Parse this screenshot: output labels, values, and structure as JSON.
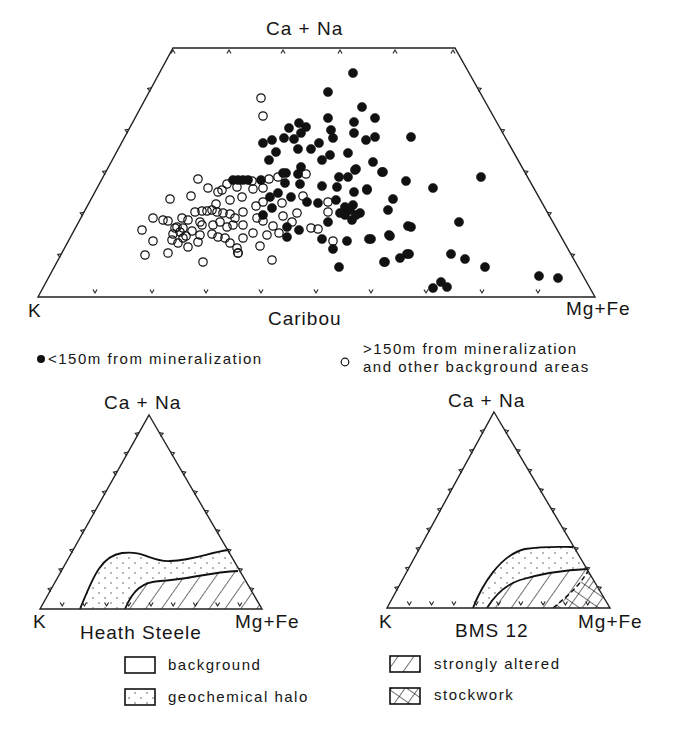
{
  "figure": {
    "caribou": {
      "title": "Caribou",
      "apex_label": "Ca + Na",
      "left_label": "K",
      "right_label": "Mg+Fe",
      "legend": {
        "filled": "<150m from mineralization",
        "open_line1": ">150m from mineralization",
        "open_line2": "and other background areas"
      }
    },
    "heath_steele": {
      "title": "Heath Steele",
      "apex_label": "Ca + Na",
      "left_label": "K",
      "right_label": "Mg+Fe"
    },
    "bms12": {
      "title": "BMS 12",
      "apex_label": "Ca + Na",
      "left_label": "K",
      "right_label": "Mg+Fe"
    },
    "field_legend": {
      "background": "background",
      "halo": "geochemical halo",
      "altered": "strongly altered",
      "stockwork": "stockwork"
    }
  },
  "chart_data": [
    {
      "type": "scatter",
      "title": "Caribou",
      "subtype": "ternary (truncated trapezoid)",
      "axes": {
        "apex": "Ca + Na",
        "left": "K",
        "right": "Mg+Fe"
      },
      "note": "points given in image pixel coordinates of the rendered figure",
      "series": [
        {
          "name": "<150m from mineralization",
          "marker": "filled-circle",
          "points": [
            [
              353,
              73
            ],
            [
              328,
              92
            ],
            [
              362,
              107
            ],
            [
              328,
              118
            ],
            [
              354,
              122
            ],
            [
              375,
              118
            ],
            [
              289,
              128
            ],
            [
              299,
              123
            ],
            [
              306,
              127
            ],
            [
              331,
              130
            ],
            [
              354,
              133
            ],
            [
              301,
              133
            ],
            [
              333,
              138
            ],
            [
              366,
              140
            ],
            [
              375,
              137
            ],
            [
              411,
              137
            ],
            [
              284,
              138
            ],
            [
              294,
              139
            ],
            [
              272,
              140
            ],
            [
              263,
              143
            ],
            [
              319,
              143
            ],
            [
              298,
              149
            ],
            [
              311,
              149
            ],
            [
              276,
              152
            ],
            [
              348,
              153
            ],
            [
              330,
              155
            ],
            [
              322,
              160
            ],
            [
              269,
              160
            ],
            [
              373,
              162
            ],
            [
              356,
              169
            ],
            [
              382,
              172
            ],
            [
              301,
              167
            ],
            [
              286,
              173
            ],
            [
              339,
              177
            ],
            [
              348,
              177
            ],
            [
              406,
              181
            ],
            [
              367,
              189
            ],
            [
              354,
              192
            ],
            [
              283,
              173
            ],
            [
              298,
              174
            ],
            [
              355,
              170
            ],
            [
              261,
              180
            ],
            [
              243,
              180
            ],
            [
              233,
              180
            ],
            [
              238,
              180
            ],
            [
              248,
              180
            ],
            [
              285,
              183
            ],
            [
              300,
              184
            ],
            [
              322,
              186
            ],
            [
              337,
              187
            ],
            [
              367,
              190
            ],
            [
              278,
              193
            ],
            [
              270,
              197
            ],
            [
              291,
              197
            ],
            [
              307,
              202
            ],
            [
              318,
              203
            ],
            [
              336,
              200
            ],
            [
              393,
              199
            ],
            [
              272,
              208
            ],
            [
              345,
              207
            ],
            [
              353,
              205
            ],
            [
              360,
              213
            ],
            [
              352,
              220
            ],
            [
              388,
              210
            ],
            [
              263,
              215
            ],
            [
              287,
              227
            ],
            [
              328,
              222
            ],
            [
              299,
              230
            ],
            [
              287,
              237
            ],
            [
              322,
              239
            ],
            [
              347,
              241
            ],
            [
              369,
              239
            ],
            [
              389,
              235
            ],
            [
              333,
              249
            ],
            [
              408,
              226
            ],
            [
              385,
              262
            ],
            [
              400,
              258
            ],
            [
              407,
              254
            ],
            [
              339,
              267
            ],
            [
              383,
              172
            ],
            [
              481,
              177
            ],
            [
              433,
              188
            ],
            [
              459,
              222
            ],
            [
              411,
              227
            ],
            [
              371,
              239
            ],
            [
              390,
              236
            ],
            [
              409,
              254
            ],
            [
              384,
              262
            ],
            [
              451,
              254
            ],
            [
              465,
              259
            ],
            [
              485,
              267
            ],
            [
              539,
              276
            ],
            [
              558,
              278
            ],
            [
              433,
              288
            ],
            [
              441,
              282
            ],
            [
              447,
              287
            ],
            [
              350,
              210
            ],
            [
              356,
              215
            ],
            [
              345,
              215
            ],
            [
              340,
              213
            ]
          ]
        },
        {
          "name": ">150m from mineralization and other background areas",
          "marker": "open-circle",
          "points": [
            [
              261,
              98
            ],
            [
              263,
              116
            ],
            [
              306,
              174
            ],
            [
              269,
              179
            ],
            [
              252,
              181
            ],
            [
              278,
              177
            ],
            [
              237,
              187
            ],
            [
              253,
              189
            ],
            [
              263,
              188
            ],
            [
              242,
              197
            ],
            [
              282,
              203
            ],
            [
              303,
              196
            ],
            [
              256,
              206
            ],
            [
              263,
              202
            ],
            [
              243,
              212
            ],
            [
              328,
              202
            ],
            [
              328,
              212
            ],
            [
              297,
              213
            ],
            [
              283,
              216
            ],
            [
              257,
              218
            ],
            [
              263,
              221
            ],
            [
              235,
              218
            ],
            [
              243,
              225
            ],
            [
              273,
              226
            ],
            [
              292,
              222
            ],
            [
              311,
              228
            ],
            [
              318,
              229
            ],
            [
              253,
              233
            ],
            [
              267,
              235
            ],
            [
              279,
              233
            ],
            [
              333,
              241
            ],
            [
              243,
              238
            ],
            [
              260,
              246
            ],
            [
              237,
              248
            ],
            [
              238,
              253
            ],
            [
              272,
              260
            ],
            [
              198,
              179
            ],
            [
              208,
              188
            ],
            [
              218,
              192
            ],
            [
              222,
              190
            ],
            [
              227,
              184
            ],
            [
              170,
              199
            ],
            [
              191,
              196
            ],
            [
              230,
              200
            ],
            [
              153,
              218
            ],
            [
              163,
              220
            ],
            [
              168,
              221
            ],
            [
              182,
              218
            ],
            [
              188,
              220
            ],
            [
              195,
              212
            ],
            [
              202,
              211
            ],
            [
              207,
              211
            ],
            [
              212,
              210
            ],
            [
              217,
              212
            ],
            [
              223,
              213
            ],
            [
              230,
              214
            ],
            [
              216,
              204
            ],
            [
              142,
              230
            ],
            [
              177,
              227
            ],
            [
              183,
              228
            ],
            [
              192,
              231
            ],
            [
              200,
              222
            ],
            [
              202,
              225
            ],
            [
              213,
              225
            ],
            [
              220,
              222
            ],
            [
              227,
              227
            ],
            [
              233,
              225
            ],
            [
              173,
              234
            ],
            [
              183,
              238
            ],
            [
              200,
              235
            ],
            [
              212,
              234
            ],
            [
              218,
              237
            ],
            [
              225,
              238
            ],
            [
              230,
              243
            ],
            [
              153,
              241
            ],
            [
              172,
              240
            ],
            [
              178,
              243
            ],
            [
              188,
              247
            ],
            [
              198,
              242
            ],
            [
              168,
              253
            ],
            [
              238,
              253
            ],
            [
              145,
              255
            ],
            [
              203,
              262
            ],
            [
              180,
              232
            ],
            [
              186,
              236
            ],
            [
              175,
              228
            ]
          ]
        }
      ]
    },
    {
      "type": "area",
      "title": "Heath Steele",
      "subtype": "ternary field diagram",
      "axes": {
        "apex": "Ca + Na",
        "left": "K",
        "right": "Mg+Fe"
      },
      "fields": [
        "background",
        "geochemical halo",
        "strongly altered"
      ]
    },
    {
      "type": "area",
      "title": "BMS 12",
      "subtype": "ternary field diagram",
      "axes": {
        "apex": "Ca + Na",
        "left": "K",
        "right": "Mg+Fe"
      },
      "fields": [
        "background",
        "geochemical halo",
        "strongly altered",
        "stockwork"
      ]
    }
  ]
}
